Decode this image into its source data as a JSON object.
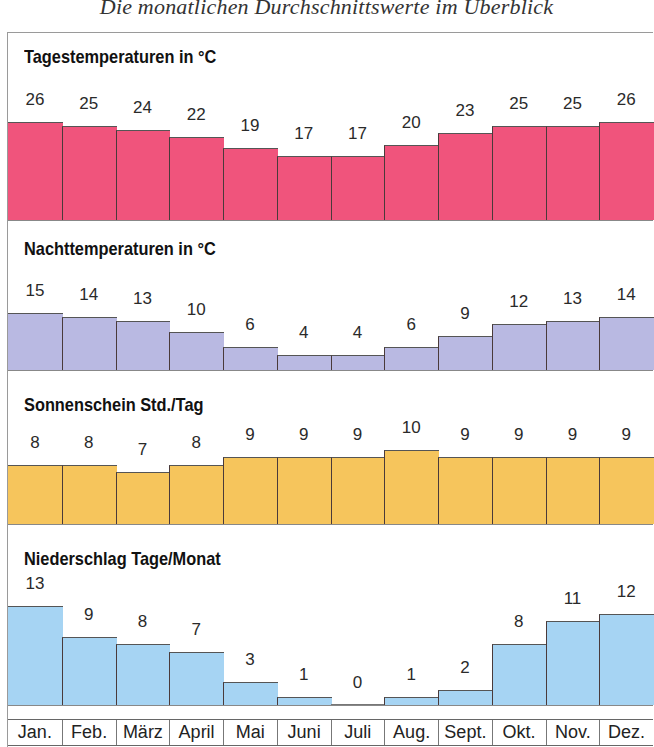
{
  "title": "Die monatlichen Durchschnittswerte im Überblick",
  "months": [
    "Jan.",
    "Feb.",
    "März",
    "April",
    "Mai",
    "Juni",
    "Juli",
    "Aug.",
    "Sept.",
    "Okt.",
    "Nov.",
    "Dez."
  ],
  "sections": [
    {
      "title": "Tagestemperaturen in °C",
      "color": "#f0547c",
      "values": [
        26,
        25,
        24,
        22,
        19,
        17,
        17,
        20,
        23,
        25,
        25,
        26
      ]
    },
    {
      "title": "Nachttemperaturen in °C",
      "color": "#b9b9e2",
      "values": [
        15,
        14,
        13,
        10,
        6,
        4,
        4,
        6,
        9,
        12,
        13,
        14
      ]
    },
    {
      "title": "Sonnenschein Std./Tag",
      "color": "#f6c55c",
      "values": [
        8,
        8,
        7,
        8,
        9,
        9,
        9,
        10,
        9,
        9,
        9,
        9
      ]
    },
    {
      "title": "Niederschlag Tage/Monat",
      "color": "#a6d4f3",
      "values": [
        13,
        9,
        8,
        7,
        3,
        1,
        0,
        1,
        2,
        8,
        11,
        12
      ]
    }
  ],
  "chart_data": [
    {
      "type": "bar",
      "title": "Tagestemperaturen in °C",
      "categories": [
        "Jan.",
        "Feb.",
        "März",
        "April",
        "Mai",
        "Juni",
        "Juli",
        "Aug.",
        "Sept.",
        "Okt.",
        "Nov.",
        "Dez."
      ],
      "values": [
        26,
        25,
        24,
        22,
        19,
        17,
        17,
        20,
        23,
        25,
        25,
        26
      ],
      "xlabel": "",
      "ylabel": "°C",
      "grid": false,
      "color": "#f0547c"
    },
    {
      "type": "bar",
      "title": "Nachttemperaturen in °C",
      "categories": [
        "Jan.",
        "Feb.",
        "März",
        "April",
        "Mai",
        "Juni",
        "Juli",
        "Aug.",
        "Sept.",
        "Okt.",
        "Nov.",
        "Dez."
      ],
      "values": [
        15,
        14,
        13,
        10,
        6,
        4,
        4,
        6,
        9,
        12,
        13,
        14
      ],
      "xlabel": "",
      "ylabel": "°C",
      "grid": false,
      "color": "#b9b9e2"
    },
    {
      "type": "bar",
      "title": "Sonnenschein Std./Tag",
      "categories": [
        "Jan.",
        "Feb.",
        "März",
        "April",
        "Mai",
        "Juni",
        "Juli",
        "Aug.",
        "Sept.",
        "Okt.",
        "Nov.",
        "Dez."
      ],
      "values": [
        8,
        8,
        7,
        8,
        9,
        9,
        9,
        10,
        9,
        9,
        9,
        9
      ],
      "xlabel": "",
      "ylabel": "Std./Tag",
      "grid": false,
      "color": "#f6c55c"
    },
    {
      "type": "bar",
      "title": "Niederschlag Tage/Monat",
      "categories": [
        "Jan.",
        "Feb.",
        "März",
        "April",
        "Mai",
        "Juni",
        "Juli",
        "Aug.",
        "Sept.",
        "Okt.",
        "Nov.",
        "Dez."
      ],
      "values": [
        13,
        9,
        8,
        7,
        3,
        1,
        0,
        1,
        2,
        8,
        11,
        12
      ],
      "xlabel": "",
      "ylabel": "Tage/Monat",
      "grid": false,
      "color": "#a6d4f3"
    }
  ]
}
